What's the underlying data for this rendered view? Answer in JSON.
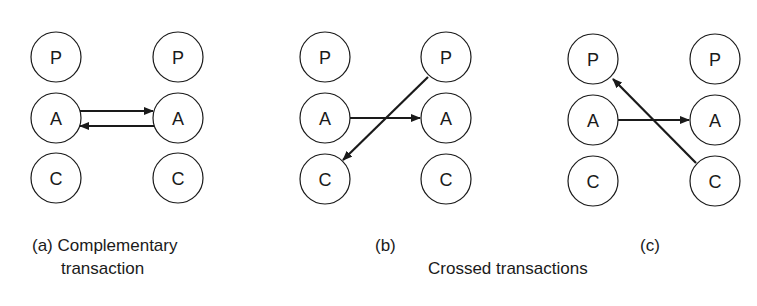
{
  "figure": {
    "node_labels": {
      "parent": "P",
      "adult": "A",
      "child": "C"
    },
    "panels": [
      {
        "id": "a",
        "caption_line1": "(a) Complementary",
        "caption_line2": "transaction",
        "arrows": [
          {
            "from": "left-A",
            "to": "right-A"
          },
          {
            "from": "right-A",
            "to": "left-A"
          }
        ]
      },
      {
        "id": "b",
        "caption": "(b)",
        "arrows": [
          {
            "from": "left-A",
            "to": "right-A"
          },
          {
            "from": "right-P",
            "to": "left-C"
          }
        ]
      },
      {
        "id": "c",
        "caption": "(c)",
        "arrows": [
          {
            "from": "left-A",
            "to": "right-A"
          },
          {
            "from": "right-C",
            "to": "left-P"
          }
        ]
      }
    ],
    "group_caption": "Crossed transactions",
    "colors": {
      "stroke": "#1a1a1a",
      "background": "#ffffff"
    }
  }
}
